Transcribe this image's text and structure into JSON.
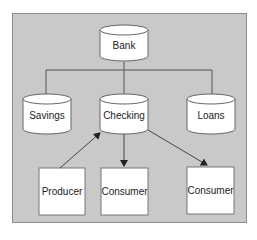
{
  "diagram": {
    "background_color": "#c9c9c9",
    "node_fill": "#ffffff",
    "stroke_color": "#555555",
    "nodes": [
      {
        "id": "bank",
        "label": "Bank",
        "shape": "cylinder"
      },
      {
        "id": "savings",
        "label": "Savings",
        "shape": "cylinder"
      },
      {
        "id": "checking",
        "label": "Checking",
        "shape": "cylinder"
      },
      {
        "id": "loans",
        "label": "Loans",
        "shape": "cylinder"
      },
      {
        "id": "producer",
        "label": "Producer",
        "shape": "box"
      },
      {
        "id": "consumer1",
        "label": "Consumer",
        "shape": "box"
      },
      {
        "id": "consumer2",
        "label": "Consumer",
        "shape": "box"
      }
    ],
    "edges": [
      {
        "from": "bank",
        "to": "savings",
        "type": "tree-line"
      },
      {
        "from": "bank",
        "to": "checking",
        "type": "tree-line"
      },
      {
        "from": "bank",
        "to": "loans",
        "type": "tree-line"
      },
      {
        "from": "producer",
        "to": "checking",
        "type": "arrow"
      },
      {
        "from": "checking",
        "to": "consumer1",
        "type": "arrow"
      },
      {
        "from": "checking",
        "to": "consumer2",
        "type": "arrow"
      }
    ]
  }
}
